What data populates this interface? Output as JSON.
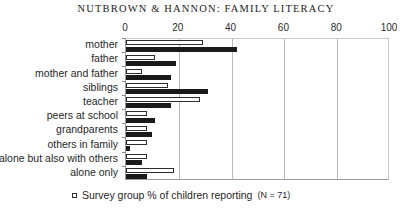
{
  "chart_data": {
    "type": "bar",
    "orientation": "horizontal",
    "title": "NUTBROWN & HANNON: FAMILY LITERACY",
    "xlabel": "",
    "ylabel": "",
    "xlim": [
      0,
      100
    ],
    "xticks": [
      0,
      20,
      40,
      60,
      80,
      100
    ],
    "grid": true,
    "legend_position": "bottom-left",
    "categories": [
      "mother",
      "father",
      "mother and father",
      "siblings",
      "teacher",
      "peers at school",
      "grandparents",
      "others in family",
      "alone but also with others",
      "alone only"
    ],
    "series": [
      {
        "name": "Survey group % of children reporting (N = 71)",
        "style": "white",
        "values": [
          29,
          11,
          6,
          16,
          28,
          8,
          8,
          8,
          8,
          18
        ]
      },
      {
        "name": "second series",
        "style": "black",
        "values": [
          42,
          19,
          17,
          31,
          17,
          11,
          10,
          1.5,
          6,
          8
        ]
      }
    ]
  },
  "title": {
    "text": "NUTBROWN & HANNON: FAMILY LITERACY"
  },
  "axis": {
    "tick_labels": [
      "0",
      "20",
      "40",
      "60",
      "80",
      "100"
    ]
  },
  "legend": {
    "label": "Survey group % of children reporting",
    "n_text": "(N = 71)"
  }
}
